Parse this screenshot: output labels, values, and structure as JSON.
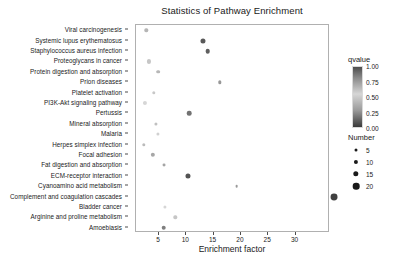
{
  "chart_data": {
    "type": "scatter",
    "title": "Statistics of Pathway Enrichment",
    "xlabel": "Enrichment factor",
    "ylabel": "",
    "xlim": [
      1.2,
      38.5
    ],
    "xticks": [
      5,
      10,
      15,
      20,
      25,
      30
    ],
    "grid": false,
    "categories": [
      "Viral carcinogenesis",
      "Systemic lupus erythematosus",
      "Staphylococcus aureus infection",
      "Proteoglycans in cancer",
      "Protein digestion and absorption",
      "Prion diseases",
      "Platelet activation",
      "PI3K-Akt signaling pathway",
      "Pertussis",
      "Mineral absorption",
      "Malaria",
      "Herpes simplex infection",
      "Focal adhesion",
      "Fat digestion and absorption",
      "ECM-receptor interaction",
      "Cyanoamino acid metabolism",
      "Complement and coagulation cascades",
      "Bladder cancer",
      "Arginine and proline metabolism",
      "Amoebiasis"
    ],
    "points": [
      {
        "pathway": "Viral carcinogenesis",
        "enrichment_factor": 2.7,
        "number": 6,
        "qvalue": 0.62
      },
      {
        "pathway": "Systemic lupus erythematosus",
        "enrichment_factor": 13.0,
        "number": 13,
        "qvalue": 0.1
      },
      {
        "pathway": "Staphylococcus aureus infection",
        "enrichment_factor": 13.9,
        "number": 11,
        "qvalue": 0.12
      },
      {
        "pathway": "Proteoglycans in cancer",
        "enrichment_factor": 3.1,
        "number": 9,
        "qvalue": 0.45
      },
      {
        "pathway": "Protein digestion and absorption",
        "enrichment_factor": 4.9,
        "number": 7,
        "qvalue": 0.4
      },
      {
        "pathway": "Prion diseases",
        "enrichment_factor": 16.1,
        "number": 6,
        "qvalue": 0.3
      },
      {
        "pathway": "Platelet activation",
        "enrichment_factor": 4.0,
        "number": 6,
        "qvalue": 0.55
      },
      {
        "pathway": "PI3K-Akt signaling pathway",
        "enrichment_factor": 2.4,
        "number": 9,
        "qvalue": 0.5
      },
      {
        "pathway": "Pertussis",
        "enrichment_factor": 10.5,
        "number": 11,
        "qvalue": 0.18
      },
      {
        "pathway": "Mineral absorption",
        "enrichment_factor": 4.5,
        "number": 5,
        "qvalue": 0.58
      },
      {
        "pathway": "Malaria",
        "enrichment_factor": 4.8,
        "number": 5,
        "qvalue": 0.52
      },
      {
        "pathway": "Herpes simplex infection",
        "enrichment_factor": 2.2,
        "number": 6,
        "qvalue": 0.6
      },
      {
        "pathway": "Focal adhesion",
        "enrichment_factor": 3.9,
        "number": 10,
        "qvalue": 0.35
      },
      {
        "pathway": "Fat digestion and absorption",
        "enrichment_factor": 6.0,
        "number": 4,
        "qvalue": 0.68
      },
      {
        "pathway": "ECM-receptor interaction",
        "enrichment_factor": 10.3,
        "number": 13,
        "qvalue": 0.08
      },
      {
        "pathway": "Cyanoamino acid metabolism",
        "enrichment_factor": 19.2,
        "number": 3,
        "qvalue": 0.72
      },
      {
        "pathway": "Complement and coagulation cascades",
        "enrichment_factor": 37.0,
        "number": 21,
        "qvalue": 0.02
      },
      {
        "pathway": "Bladder cancer",
        "enrichment_factor": 6.1,
        "number": 5,
        "qvalue": 0.5
      },
      {
        "pathway": "Arginine and proline metabolism",
        "enrichment_factor": 8.0,
        "number": 6,
        "qvalue": 0.45
      },
      {
        "pathway": "Amoebiasis",
        "enrichment_factor": 5.9,
        "number": 11,
        "qvalue": 0.22
      }
    ],
    "legends": {
      "qvalue": {
        "title": "qvalue",
        "position": "right",
        "ticks": [
          "1.00",
          "0.75",
          "0.50",
          "0.25",
          "0.00"
        ],
        "gradient_high_color": "#4d4d4d",
        "gradient_mid_color": "#d6d6d6",
        "gradient_low_color": "#3a3a3a"
      },
      "number": {
        "title": "Number",
        "position": "right",
        "entries": [
          {
            "label": "5",
            "size": 3.0
          },
          {
            "label": "10",
            "size": 4.2
          },
          {
            "label": "15",
            "size": 5.4
          },
          {
            "label": "20",
            "size": 6.6
          }
        ]
      }
    }
  }
}
